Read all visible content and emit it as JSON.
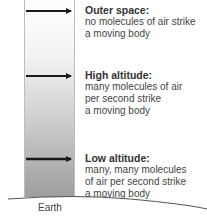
{
  "diagram": {
    "levels": [
      {
        "id": "outer-space",
        "title": "Outer space:",
        "lines": [
          "no molecules of air strike",
          "a moving body"
        ]
      },
      {
        "id": "high-altitude",
        "title": "High altitude:",
        "lines": [
          "many molecules of air",
          "per second strike",
          "a moving body"
        ]
      },
      {
        "id": "low-altitude",
        "title": "Low altitude:",
        "lines": [
          "many, many molecules",
          "of air per second strike",
          "a moving body"
        ]
      }
    ],
    "ground_label": "Earth",
    "colors": {
      "arrow": "#1a1a1a",
      "column_top": "#ffffff",
      "column_bottom": "#9e9e9e",
      "ground_line": "#555555"
    }
  }
}
